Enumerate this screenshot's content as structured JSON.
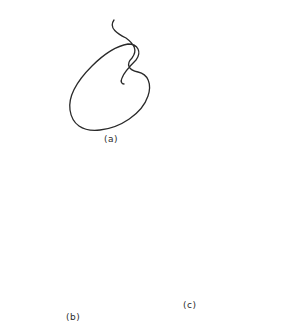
{
  "figure": {
    "type": "conformational-equilibrium-diagram",
    "stroke_color": "#2a2a2a",
    "background": "#ffffff",
    "panels": [
      {
        "id": "a",
        "label": "(a)",
        "description": "random coil chain"
      },
      {
        "id": "b",
        "label": "(b)",
        "description": "compact folded chain with stacked bead segments (rows of 3,4,2,4,3,3 beads)"
      },
      {
        "id": "c",
        "label": "(c)",
        "description": "extended chain with short helical bead segments"
      }
    ],
    "arrows": [
      {
        "from": "a",
        "to": "b",
        "type": "equilibrium"
      },
      {
        "from": "a",
        "to": "c",
        "type": "equilibrium"
      },
      {
        "from": "b",
        "to": "c",
        "type": "equilibrium"
      }
    ]
  }
}
